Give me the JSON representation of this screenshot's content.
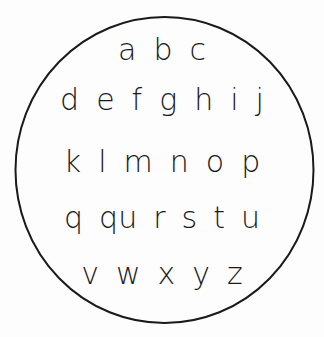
{
  "rows": [
    {
      "letters": [
        "a",
        "b",
        "c"
      ],
      "top": 35,
      "gap": 17
    },
    {
      "letters": [
        "d",
        "e",
        "f",
        "g",
        "h",
        "i",
        "j"
      ],
      "top": 85,
      "gap": 17
    },
    {
      "letters": [
        "k",
        "l",
        "m",
        "n",
        "o",
        "p"
      ],
      "top": 147,
      "gap": 17
    },
    {
      "letters": [
        "q",
        "qu",
        "r",
        "s",
        "t",
        "u"
      ],
      "top": 203,
      "gap": 16
    },
    {
      "letters": [
        "v",
        "w",
        "x",
        "y",
        "z"
      ],
      "top": 259,
      "gap": 17
    }
  ],
  "colors": {
    "stroke": "#1a1a1a",
    "background": "#fdfdfd"
  }
}
